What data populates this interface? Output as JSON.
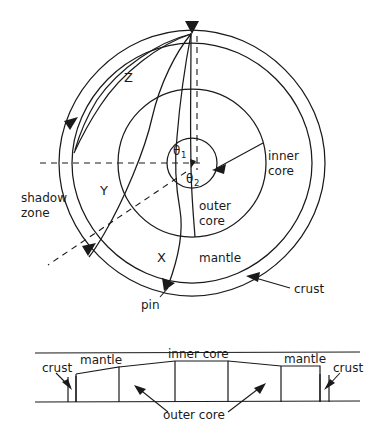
{
  "figure": {
    "title_fragment_top": "",
    "caption": ""
  },
  "main_diagram": {
    "source_marker_name": "earthquake-source",
    "layers": {
      "crust": "crust",
      "mantle": "mantle",
      "outer_core_line1": "outer",
      "outer_core_line2": "core",
      "inner_core_line1": "inner",
      "inner_core_line2": "core"
    },
    "rays": {
      "z": "Z",
      "y": "Y",
      "x": "X"
    },
    "angles": {
      "theta1_symbol": "θ",
      "theta1_sub": "1",
      "theta2_symbol": "θ",
      "theta2_sub": "2"
    },
    "annotations": {
      "shadow_zone_line1": "shadow",
      "shadow_zone_line2": "zone",
      "pin": "pin"
    },
    "geometry": {
      "center_x": 192,
      "center_y": 163,
      "crust_radius": 133,
      "mantle_radius": 120,
      "outer_core_radius": 74,
      "inner_core_radius": 25
    }
  },
  "cross_section_panel": {
    "labels": {
      "crust_left": "crust",
      "mantle_left": "mantle",
      "inner_core": "inner core",
      "mantle_right": "mantle",
      "crust_right": "crust",
      "outer_core": "outer  core"
    }
  },
  "colors": {
    "ink": "#1a1a1a",
    "background": "#ffffff"
  }
}
